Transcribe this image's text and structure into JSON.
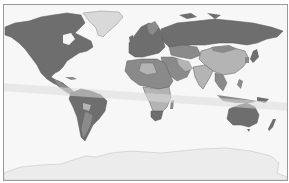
{
  "map": {
    "type": "world-choropleth",
    "colors": {
      "ocean": "#f7f7f7",
      "frame": "#9a9a9a",
      "dark": "#6e6e6e",
      "mid": "#8a8a8a",
      "light": "#b4b4b4",
      "pale": "#d9d9d9",
      "antarctica": "#ececec",
      "band": "#dcdcdc",
      "border": "#5a5a5a"
    },
    "regions": [
      {
        "name": "North America",
        "shade": "dark"
      },
      {
        "name": "Greenland",
        "shade": "pale"
      },
      {
        "name": "South America",
        "shade": "dark"
      },
      {
        "name": "Europe",
        "shade": "dark"
      },
      {
        "name": "Russia",
        "shade": "dark"
      },
      {
        "name": "China",
        "shade": "light"
      },
      {
        "name": "Africa",
        "shade": "mixed"
      },
      {
        "name": "Middle East",
        "shade": "mid"
      },
      {
        "name": "India",
        "shade": "light"
      },
      {
        "name": "Southeast Asia",
        "shade": "mid"
      },
      {
        "name": "Australia",
        "shade": "dark"
      },
      {
        "name": "New Zealand",
        "shade": "dark"
      },
      {
        "name": "Antarctica",
        "shade": "antarctica"
      }
    ],
    "band": {
      "label": "diagonal-highlight-band",
      "from": [
        0,
        86
      ],
      "to": [
        289,
        106
      ],
      "width": 8
    }
  }
}
